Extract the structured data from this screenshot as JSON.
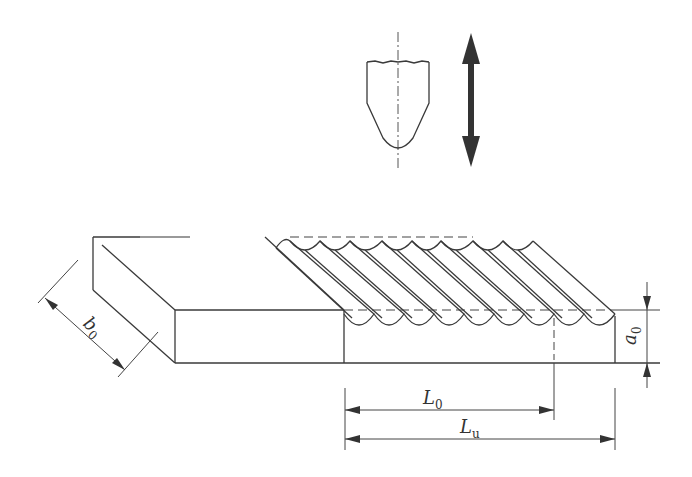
{
  "diagram": {
    "labels": {
      "b0": {
        "main": "b",
        "sub": "0"
      },
      "a0": {
        "main": "a",
        "sub": "0"
      },
      "L0": {
        "main": "L",
        "sub": "0"
      },
      "Lu": {
        "main": "L",
        "sub": "u"
      }
    },
    "components": {
      "tool": "indenter-tool",
      "motion": "double-headed-vertical-arrow",
      "specimen": "rectangular-bar-with-grooves"
    },
    "groove_count": 9,
    "colors": {
      "line": "#3a3a3a",
      "arrow": "#333333",
      "background": "#ffffff"
    }
  }
}
